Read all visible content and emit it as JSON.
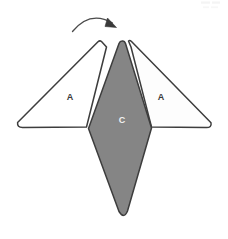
{
  "figure": {
    "background_color": "#ffffff",
    "outline_color": "#3d3d3d",
    "corner_mark": "",
    "shapes": {
      "left_flap": {
        "label": "A",
        "fill": "#ffffff",
        "stroke": "#3d3d3d",
        "label_x": 70,
        "label_y": 98,
        "label_color": "#3a3a3a"
      },
      "right_flap": {
        "label": "A",
        "fill": "#fdfdfd",
        "stroke": "#3d3d3d",
        "label_x": 161,
        "label_y": 98,
        "label_color": "#3a3a3a"
      },
      "center_kite": {
        "label": "C",
        "fill": "#858585",
        "stroke": "#3d3d3d",
        "label_x": 122,
        "label_y": 121,
        "label_color": "#f2f2f2"
      }
    },
    "arrow": {
      "name": "fold-direction-arrow",
      "color": "#4a4a4a",
      "direction": "clockwise",
      "start_x": 72,
      "start_y": 30,
      "end_x": 114,
      "end_y": 26
    }
  }
}
